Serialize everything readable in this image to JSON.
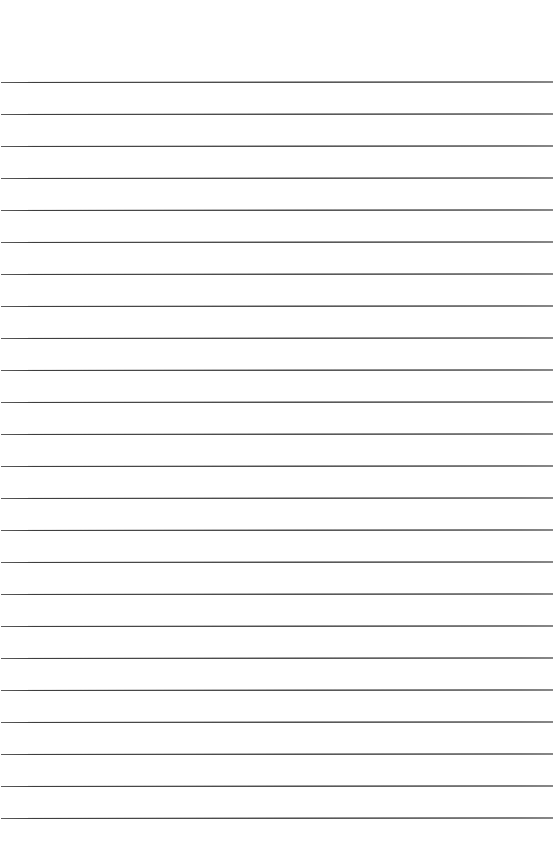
{
  "document": {
    "type": "lined-paper",
    "title": "Blank Ruled Notebook Page",
    "page_width": 555,
    "page_height": 844,
    "background_color": "#ffffff",
    "content_text": ""
  },
  "ruling": {
    "line_color": "#4a4a4a",
    "line_thickness": 1,
    "line_count": 24,
    "line_spacing": 32,
    "first_line_y": 82,
    "last_line_y": 820,
    "left_inset": 1,
    "right_inset": 2,
    "slant_degrees": -0.06,
    "style_label": "wide ruled",
    "margin_rule": "none"
  },
  "margins": {
    "top": 82,
    "bottom": 23,
    "left": 1,
    "right": 2
  },
  "lines": [
    {
      "index": 1,
      "y": 82,
      "text": ""
    },
    {
      "index": 2,
      "y": 114,
      "text": ""
    },
    {
      "index": 3,
      "y": 146,
      "text": ""
    },
    {
      "index": 4,
      "y": 178,
      "text": ""
    },
    {
      "index": 5,
      "y": 210,
      "text": ""
    },
    {
      "index": 6,
      "y": 242,
      "text": ""
    },
    {
      "index": 7,
      "y": 274,
      "text": ""
    },
    {
      "index": 8,
      "y": 306,
      "text": ""
    },
    {
      "index": 9,
      "y": 338,
      "text": ""
    },
    {
      "index": 10,
      "y": 370,
      "text": ""
    },
    {
      "index": 11,
      "y": 402,
      "text": ""
    },
    {
      "index": 12,
      "y": 434,
      "text": ""
    },
    {
      "index": 13,
      "y": 466,
      "text": ""
    },
    {
      "index": 14,
      "y": 498,
      "text": ""
    },
    {
      "index": 15,
      "y": 530,
      "text": ""
    },
    {
      "index": 16,
      "y": 562,
      "text": ""
    },
    {
      "index": 17,
      "y": 594,
      "text": ""
    },
    {
      "index": 18,
      "y": 626,
      "text": ""
    },
    {
      "index": 19,
      "y": 658,
      "text": ""
    },
    {
      "index": 20,
      "y": 690,
      "text": ""
    },
    {
      "index": 21,
      "y": 722,
      "text": ""
    },
    {
      "index": 22,
      "y": 754,
      "text": ""
    },
    {
      "index": 23,
      "y": 786,
      "text": ""
    },
    {
      "index": 24,
      "y": 818,
      "text": ""
    }
  ]
}
